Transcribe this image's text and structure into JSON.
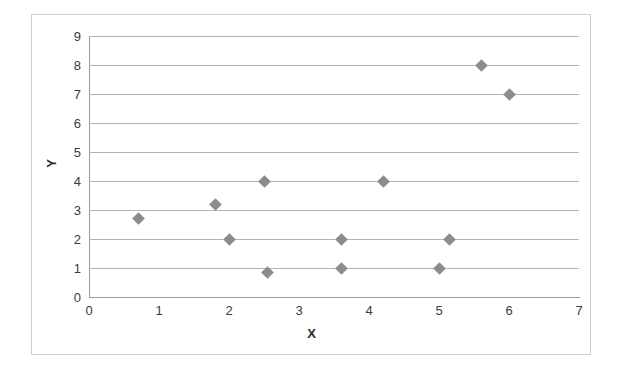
{
  "chart_data": {
    "type": "scatter",
    "title": "",
    "xlabel": "X",
    "ylabel": "Y",
    "xlim": [
      0,
      7
    ],
    "ylim": [
      0,
      9
    ],
    "x_ticks": [
      0,
      1,
      2,
      3,
      4,
      5,
      6,
      7
    ],
    "y_ticks": [
      0,
      1,
      2,
      3,
      4,
      5,
      6,
      7,
      8,
      9
    ],
    "grid": "horizontal",
    "legend": "none",
    "marker_shape": "diamond",
    "marker_color": "#8c8c8c",
    "points": [
      {
        "x": 0.7,
        "y": 2.7
      },
      {
        "x": 1.8,
        "y": 3.2
      },
      {
        "x": 2.0,
        "y": 2.0
      },
      {
        "x": 2.5,
        "y": 4.0
      },
      {
        "x": 2.55,
        "y": 0.85
      },
      {
        "x": 3.6,
        "y": 2.0
      },
      {
        "x": 3.6,
        "y": 1.0
      },
      {
        "x": 4.2,
        "y": 4.0
      },
      {
        "x": 5.0,
        "y": 1.0
      },
      {
        "x": 5.15,
        "y": 2.0
      },
      {
        "x": 5.6,
        "y": 8.0
      },
      {
        "x": 6.0,
        "y": 7.0
      }
    ]
  },
  "colors": {
    "marker": "#8c8c8c",
    "gridline": "#b4b4b4",
    "axis": "#9a9a9a",
    "frame": "#cfcfcf",
    "tick_text": "#3b3b3b"
  }
}
